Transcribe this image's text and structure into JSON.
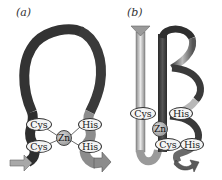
{
  "figure": {
    "panels": [
      {
        "label": "(a)",
        "title": "zinc finger loop",
        "metal": "Zn",
        "ligands": [
          "Cys",
          "Cys",
          "His",
          "His"
        ]
      },
      {
        "label": "(b)",
        "title": "zinc finger ribbon and helix",
        "metal": "Zn",
        "ligands": [
          "Cys",
          "Cys",
          "His",
          "His"
        ]
      }
    ]
  },
  "colors": {
    "dark_strand": "#3a3a3a",
    "light_strand": "#9a9a9a",
    "oval_fill": "#f4f4f4",
    "zn_fill": "#a0a0a0"
  }
}
